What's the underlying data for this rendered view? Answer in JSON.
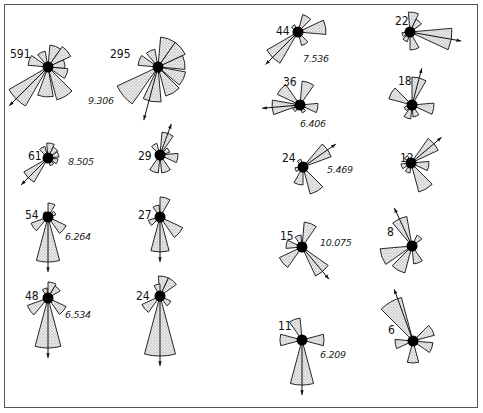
{
  "figure": {
    "type": "rose-diagram-grid",
    "fill_color": "#e4e4e4",
    "stroke_color": "#111111",
    "center_color": "#000000"
  },
  "roses": [
    {
      "id": "r591",
      "count": "591",
      "value": "9.306",
      "cx": 48,
      "cy": 67,
      "arrow": 225,
      "petals": [
        [
          20,
          22
        ],
        [
          50,
          25
        ],
        [
          80,
          17
        ],
        [
          110,
          20
        ],
        [
          150,
          34
        ],
        [
          185,
          30
        ],
        [
          225,
          45
        ],
        [
          290,
          20
        ],
        [
          335,
          16
        ]
      ]
    },
    {
      "id": "r295",
      "count": "295",
      "value": "",
      "cx": 158,
      "cy": 67,
      "arrow": 195,
      "petals": [
        [
          20,
          30
        ],
        [
          50,
          30
        ],
        [
          80,
          27
        ],
        [
          115,
          28
        ],
        [
          150,
          30
        ],
        [
          190,
          35
        ],
        [
          230,
          45
        ],
        [
          290,
          20
        ],
        [
          335,
          18
        ]
      ]
    },
    {
      "id": "r61",
      "count": "61",
      "value": "8.505",
      "cx": 48,
      "cy": 158,
      "arrow": 225,
      "petals": [
        [
          10,
          15
        ],
        [
          40,
          12
        ],
        [
          70,
          11
        ],
        [
          110,
          10
        ],
        [
          150,
          8
        ],
        [
          225,
          28
        ],
        [
          330,
          12
        ]
      ]
    },
    {
      "id": "r29",
      "count": "29",
      "value": "",
      "cx": 160,
      "cy": 155,
      "arrow": 20,
      "petals": [
        [
          20,
          23
        ],
        [
          60,
          10
        ],
        [
          100,
          18
        ],
        [
          160,
          18
        ],
        [
          200,
          18
        ],
        [
          330,
          12
        ]
      ]
    },
    {
      "id": "r54",
      "count": "54",
      "value": "6.264",
      "cx": 48,
      "cy": 217,
      "arrow": 180,
      "petals": [
        [
          15,
          14
        ],
        [
          60,
          8
        ],
        [
          130,
          20
        ],
        [
          180,
          45
        ],
        [
          235,
          18
        ],
        [
          320,
          6
        ]
      ]
    },
    {
      "id": "r27",
      "count": "27",
      "value": "",
      "cx": 160,
      "cy": 217,
      "arrow": 180,
      "petals": [
        [
          15,
          20
        ],
        [
          340,
          12
        ],
        [
          130,
          25
        ],
        [
          180,
          35
        ],
        [
          240,
          12
        ]
      ]
    },
    {
      "id": "r48",
      "count": "48",
      "value": "6.534",
      "cx": 48,
      "cy": 298,
      "arrow": 180,
      "petals": [
        [
          15,
          16
        ],
        [
          45,
          14
        ],
        [
          340,
          10
        ],
        [
          130,
          20
        ],
        [
          180,
          50
        ],
        [
          235,
          22
        ]
      ]
    },
    {
      "id": "r24a",
      "count": "24",
      "value": "",
      "cx": 160,
      "cy": 296,
      "arrow": 180,
      "petals": [
        [
          10,
          20
        ],
        [
          40,
          20
        ],
        [
          345,
          12
        ],
        [
          130,
          12
        ],
        [
          180,
          60
        ],
        [
          230,
          20
        ]
      ]
    },
    {
      "id": "r44",
      "count": "44",
      "value": "7.536",
      "cx": 298,
      "cy": 32,
      "arrow": 225,
      "petals": [
        [
          30,
          18
        ],
        [
          80,
          28
        ],
        [
          150,
          14
        ],
        [
          225,
          36
        ],
        [
          320,
          8
        ]
      ]
    },
    {
      "id": "r22",
      "count": "22",
      "value": "",
      "cx": 410,
      "cy": 32,
      "arrow": 100,
      "petals": [
        [
          10,
          20
        ],
        [
          40,
          14
        ],
        [
          100,
          42
        ],
        [
          165,
          18
        ],
        [
          210,
          10
        ],
        [
          250,
          8
        ]
      ]
    },
    {
      "id": "r36",
      "count": "36",
      "value": "6.406",
      "cx": 300,
      "cy": 105,
      "arrow": 265,
      "petals": [
        [
          20,
          24
        ],
        [
          100,
          18
        ],
        [
          150,
          8
        ],
        [
          230,
          8
        ],
        [
          265,
          28
        ],
        [
          310,
          25
        ]
      ]
    },
    {
      "id": "r18",
      "count": "18",
      "value": "",
      "cx": 412,
      "cy": 105,
      "arrow": 15,
      "petals": [
        [
          15,
          28
        ],
        [
          100,
          22
        ],
        [
          160,
          12
        ],
        [
          200,
          14
        ],
        [
          240,
          8
        ],
        [
          300,
          24
        ]
      ]
    },
    {
      "id": "r24b",
      "count": "24",
      "value": "5.469",
      "cx": 303,
      "cy": 167,
      "arrow": 55,
      "petals": [
        [
          55,
          30
        ],
        [
          150,
          28
        ],
        [
          195,
          18
        ],
        [
          250,
          8
        ],
        [
          330,
          8
        ]
      ]
    },
    {
      "id": "r12",
      "count": "12",
      "value": "",
      "cx": 411,
      "cy": 163,
      "arrow": 50,
      "petals": [
        [
          50,
          30
        ],
        [
          100,
          18
        ],
        [
          150,
          30
        ],
        [
          200,
          10
        ],
        [
          250,
          10
        ],
        [
          320,
          8
        ]
      ]
    },
    {
      "id": "r15",
      "count": "15",
      "value": "10.075",
      "cx": 302,
      "cy": 247,
      "arrow": 140,
      "petals": [
        [
          20,
          25
        ],
        [
          340,
          12
        ],
        [
          140,
          32
        ],
        [
          230,
          25
        ],
        [
          280,
          16
        ]
      ]
    },
    {
      "id": "r8",
      "count": "8",
      "value": "",
      "cx": 412,
      "cy": 246,
      "arrow": 335,
      "petals": [
        [
          335,
          30
        ],
        [
          40,
          12
        ],
        [
          160,
          18
        ],
        [
          210,
          28
        ],
        [
          250,
          32
        ]
      ]
    },
    {
      "id": "r11",
      "count": "11",
      "value": "6.209",
      "cx": 302,
      "cy": 340,
      "arrow": 180,
      "petals": [
        [
          340,
          22
        ],
        [
          90,
          22
        ],
        [
          180,
          45
        ],
        [
          270,
          22
        ]
      ]
    },
    {
      "id": "r6",
      "count": "6",
      "value": "",
      "cx": 413,
      "cy": 341,
      "arrow": 340,
      "petals": [
        [
          330,
          45
        ],
        [
          60,
          22
        ],
        [
          110,
          20
        ],
        [
          180,
          22
        ],
        [
          260,
          18
        ]
      ]
    }
  ],
  "labels": {
    "r591": {
      "count": [
        10,
        58
      ],
      "value": [
        88,
        104
      ]
    },
    "r295": {
      "count": [
        110,
        58
      ]
    },
    "r61": {
      "count": [
        28,
        160
      ],
      "value": [
        68,
        165
      ]
    },
    "r29": {
      "count": [
        138,
        160
      ]
    },
    "r54": {
      "count": [
        25,
        219
      ],
      "value": [
        65,
        240
      ]
    },
    "r27": {
      "count": [
        138,
        219
      ]
    },
    "r48": {
      "count": [
        25,
        300
      ],
      "value": [
        65,
        318
      ]
    },
    "r24a": {
      "count": [
        136,
        300
      ]
    },
    "r44": {
      "count": [
        276,
        35
      ],
      "value": [
        303,
        62
      ]
    },
    "r22": {
      "count": [
        395,
        25
      ]
    },
    "r36": {
      "count": [
        283,
        86
      ],
      "value": [
        300,
        127
      ]
    },
    "r18": {
      "count": [
        398,
        85
      ]
    },
    "r24b": {
      "count": [
        282,
        162
      ],
      "value": [
        327,
        173
      ]
    },
    "r12": {
      "count": [
        400,
        162
      ]
    },
    "r15": {
      "count": [
        280,
        240
      ],
      "value": [
        320,
        246
      ]
    },
    "r8": {
      "count": [
        387,
        236
      ]
    },
    "r11": {
      "count": [
        278,
        330
      ],
      "value": [
        320,
        358
      ]
    },
    "r6": {
      "count": [
        388,
        334
      ]
    }
  }
}
